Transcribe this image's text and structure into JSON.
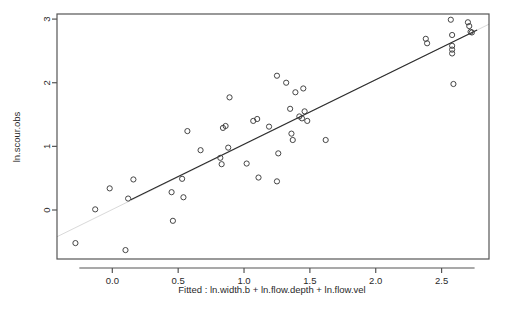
{
  "chart_data": {
    "type": "scatter",
    "title": "",
    "xlabel": "Fitted : ln.width.b + ln.flow.depth + ln.flow.vel",
    "ylabel": "ln.scour.obs",
    "xlim": [
      -0.42,
      2.86
    ],
    "ylim": [
      -0.77,
      3.08
    ],
    "xticks": [
      0.0,
      0.5,
      1.0,
      1.5,
      2.0,
      2.5
    ],
    "xtick_labels": [
      "0.0",
      "0.5",
      "1.0",
      "1.5",
      "2.0",
      "2.5"
    ],
    "yticks": [
      0,
      1,
      2,
      3
    ],
    "ytick_labels": [
      "0",
      "1",
      "2",
      "3"
    ],
    "grid": false,
    "legend": "none",
    "marker": "open-circle",
    "marker_color": "#3c3c3c",
    "line_color": "#2b2b2b",
    "axis_color": "#555555",
    "points": [
      [
        -0.28,
        -0.52
      ],
      [
        -0.13,
        0.01
      ],
      [
        -0.02,
        0.34
      ],
      [
        0.1,
        -0.63
      ],
      [
        0.12,
        0.18
      ],
      [
        0.16,
        0.48
      ],
      [
        0.45,
        0.28
      ],
      [
        0.46,
        -0.17
      ],
      [
        0.53,
        0.49
      ],
      [
        0.54,
        0.2
      ],
      [
        0.57,
        1.24
      ],
      [
        0.67,
        0.94
      ],
      [
        0.82,
        0.82
      ],
      [
        0.83,
        0.72
      ],
      [
        0.84,
        1.29
      ],
      [
        0.86,
        1.32
      ],
      [
        0.88,
        0.98
      ],
      [
        0.89,
        1.77
      ],
      [
        1.02,
        0.73
      ],
      [
        1.07,
        1.4
      ],
      [
        1.1,
        1.43
      ],
      [
        1.11,
        0.51
      ],
      [
        1.19,
        1.31
      ],
      [
        1.25,
        2.11
      ],
      [
        1.25,
        0.45
      ],
      [
        1.26,
        0.89
      ],
      [
        1.32,
        2.0
      ],
      [
        1.35,
        1.59
      ],
      [
        1.36,
        1.2
      ],
      [
        1.37,
        1.1
      ],
      [
        1.39,
        1.85
      ],
      [
        1.42,
        1.47
      ],
      [
        1.44,
        1.44
      ],
      [
        1.45,
        1.91
      ],
      [
        1.46,
        1.55
      ],
      [
        1.48,
        1.4
      ],
      [
        1.62,
        1.1
      ],
      [
        2.38,
        2.69
      ],
      [
        2.39,
        2.62
      ],
      [
        2.57,
        2.99
      ],
      [
        2.58,
        2.75
      ],
      [
        2.58,
        2.58
      ],
      [
        2.58,
        2.52
      ],
      [
        2.58,
        2.46
      ],
      [
        2.59,
        1.98
      ],
      [
        2.7,
        2.95
      ],
      [
        2.71,
        2.89
      ],
      [
        2.72,
        2.8
      ],
      [
        2.73,
        2.79
      ]
    ],
    "fit_line": {
      "x1": -0.42,
      "y1": -0.42,
      "x2": 2.86,
      "y2": 2.92,
      "solid_x1": 0.14,
      "solid_y1": 0.16,
      "solid_x2": 2.77,
      "solid_y2": 2.83
    }
  }
}
